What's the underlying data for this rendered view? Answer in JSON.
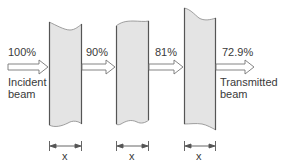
{
  "diagram": {
    "colors": {
      "slab_fill": "#e4e4e4",
      "slab_edge": "#555555",
      "arrow": "#777777",
      "text": "#3a3a3a"
    },
    "stages": [
      {
        "percent": "100%",
        "caption_line1": "Incident",
        "caption_line2": "beam"
      },
      {
        "percent": "90%"
      },
      {
        "percent": "81%"
      },
      {
        "percent": "72.9%",
        "caption_line1": "Transmitted",
        "caption_line2": "beam"
      }
    ],
    "slabs": [
      {
        "thickness_label": "x"
      },
      {
        "thickness_label": "x"
      },
      {
        "thickness_label": "x"
      }
    ]
  }
}
